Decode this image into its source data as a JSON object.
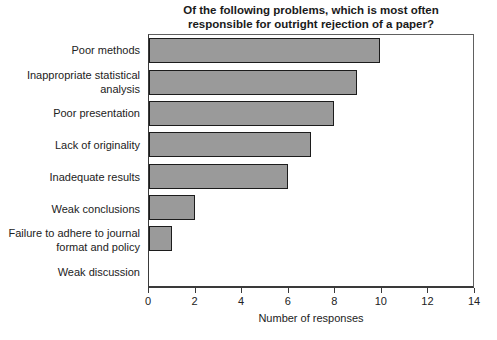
{
  "figure": {
    "title_lines": [
      "Of the following problems, which is most often",
      "responsible for outright rejection of a paper?"
    ]
  },
  "chart_data": {
    "type": "bar",
    "orientation": "horizontal",
    "title": "Of the following problems, which is most often responsible for outright rejection of a paper?",
    "categories": [
      "Poor methods",
      "Inappropriate statistical analysis",
      "Poor presentation",
      "Lack of originality",
      "Inadequate results",
      "Weak conclusions",
      "Failure to adhere to journal format and policy",
      "Weak discussion"
    ],
    "values": [
      10,
      9,
      8,
      7,
      6,
      2,
      1,
      0
    ],
    "xlabel": "Number of responses",
    "xlim": [
      0,
      14
    ],
    "xticks": [
      0,
      2,
      4,
      6,
      8,
      10,
      12,
      14
    ],
    "grid": false,
    "colors": {
      "bar_fill": "#9a9a9a",
      "bar_border": "#1c1c1c",
      "axis": "#3a3a3a"
    }
  }
}
